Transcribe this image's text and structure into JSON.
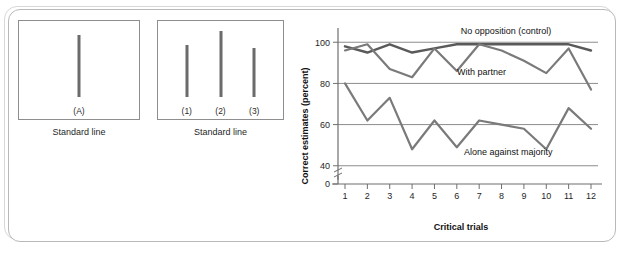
{
  "stimulus": {
    "standard_panel": {
      "caption": "Standard line",
      "lines": [
        {
          "label": "(A)",
          "x_pct": 50,
          "height": 62
        }
      ]
    },
    "comparison_panel": {
      "caption": "Standard line",
      "lines": [
        {
          "label": "(1)",
          "x_pct": 23,
          "height": 52
        },
        {
          "label": "(2)",
          "x_pct": 50,
          "height": 66
        },
        {
          "label": "(3)",
          "x_pct": 77,
          "height": 49
        }
      ]
    }
  },
  "chart_data": {
    "type": "line",
    "title": "",
    "xlabel": "Critical trials",
    "ylabel": "Correct estimates (percent)",
    "x": [
      1,
      2,
      3,
      4,
      5,
      6,
      7,
      8,
      9,
      10,
      11,
      12
    ],
    "xtick_labels": [
      "1",
      "2",
      "3",
      "4",
      "5",
      "6",
      "7",
      "8",
      "9",
      "10",
      "11",
      "12"
    ],
    "ytick_labels": [
      "0",
      "40",
      "60",
      "80",
      "100"
    ],
    "yticks": [
      0,
      40,
      60,
      80,
      100
    ],
    "ylim": [
      0,
      104
    ],
    "axis_break": true,
    "axis_break_between": [
      0,
      40
    ],
    "grid": "horizontal",
    "legend_position": "inline-annotations",
    "series": [
      {
        "name": "No opposition (control)",
        "label": "No opposition (control)",
        "label_x": 8.2,
        "label_y": 104,
        "color": "#5a5a5a",
        "values": [
          98,
          95,
          99,
          95,
          97,
          99,
          99,
          99,
          99,
          99,
          99,
          96
        ]
      },
      {
        "name": "With partner",
        "label": "With partner",
        "label_x": 7.1,
        "label_y": 84,
        "color": "#7a7a7a",
        "values": [
          96,
          99,
          87,
          83,
          97,
          86,
          99,
          96,
          91,
          85,
          97,
          77
        ]
      },
      {
        "name": "Alone against majority",
        "label": "Alone against majority",
        "label_x": 8.3,
        "label_y": 45,
        "color": "#7a7a7a",
        "values": [
          80,
          62,
          73,
          48,
          62,
          49,
          62,
          60,
          58,
          48,
          68,
          58
        ]
      }
    ]
  },
  "colors": {
    "frame": "#b9b9b9",
    "panel_border": "#8e8e8e",
    "stimulus_line": "#6b6b6b",
    "gridline": "#8c8c8c",
    "axis": "#6f6f6f",
    "text": "#111111"
  }
}
